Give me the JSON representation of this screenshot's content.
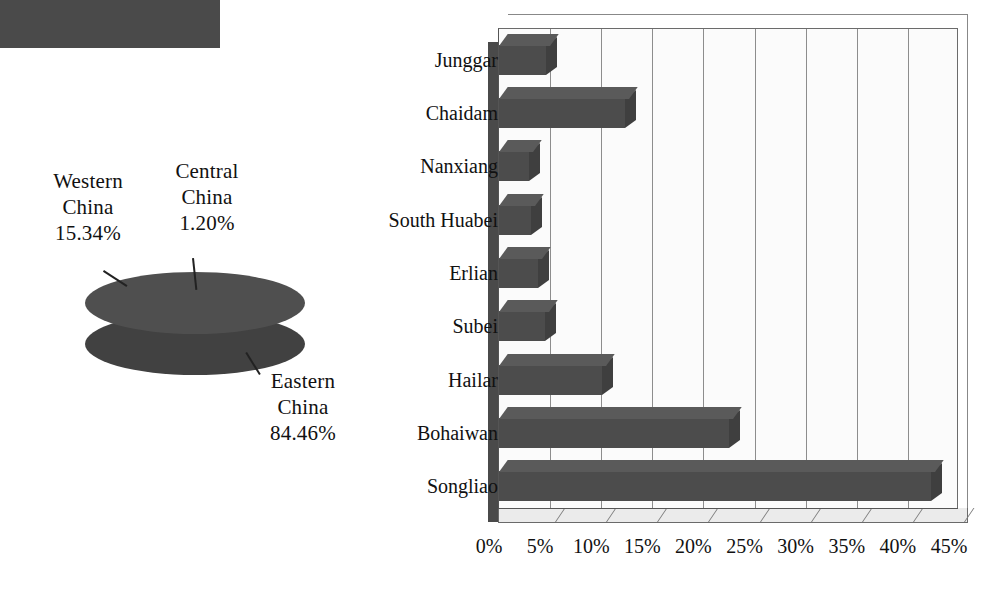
{
  "figure": {
    "title": "",
    "panels": [
      "pie-chart-china-regions",
      "bar-chart-basin-share"
    ]
  },
  "pie": {
    "slices": [
      {
        "name": "Western China",
        "line1": "Western",
        "line2": "China",
        "value_label": "15.34%",
        "value": 15.34
      },
      {
        "name": "Central China",
        "line1": "Central",
        "line2": "China",
        "value_label": "1.20%",
        "value": 1.2
      },
      {
        "name": "Eastern China",
        "line1": "Eastern",
        "line2": "China",
        "value_label": "84.46%",
        "value": 84.46
      }
    ],
    "fill_color": "#4a4a4a"
  },
  "bar": {
    "axis_ticks": [
      "0%",
      "5%",
      "10%",
      "15%",
      "20%",
      "25%",
      "30%",
      "35%",
      "40%",
      "45%"
    ],
    "categories": [
      "Junggar",
      "Chaidam",
      "Nanxiang",
      "South Huabei",
      "Erlian",
      "Subei",
      "Hailar",
      "Bohaiwan",
      "Songliao"
    ],
    "bar_color": "#4c4c4c",
    "grid_color": "#8d8d8d"
  },
  "chart_data": [
    {
      "type": "pie",
      "title": "",
      "labels": [
        "Western China",
        "Central China",
        "Eastern China"
      ],
      "values": [
        15.34,
        1.2,
        84.46
      ],
      "value_labels": [
        "15.34%",
        "1.20%",
        "84.46%"
      ],
      "unit": "%",
      "style": "3d-pie",
      "legend": "none",
      "annotations": [
        "Western China 15.34%",
        "Central China 1.20%",
        "Eastern China 84.46%"
      ]
    },
    {
      "type": "bar",
      "orientation": "horizontal",
      "style": "3d-bar",
      "title": "",
      "xlabel": "",
      "ylabel": "",
      "categories": [
        "Junggar",
        "Chaidam",
        "Nanxiang",
        "South Huabei",
        "Erlian",
        "Subei",
        "Hailar",
        "Bohaiwan",
        "Songliao"
      ],
      "values": [
        4.6,
        12.3,
        2.9,
        3.1,
        3.8,
        4.5,
        10.1,
        22.5,
        42.3
      ],
      "xlim": [
        0,
        45
      ],
      "xticks": [
        0,
        5,
        10,
        15,
        20,
        25,
        30,
        35,
        40,
        45
      ],
      "xticklabels": [
        "0%",
        "5%",
        "10%",
        "15%",
        "20%",
        "25%",
        "30%",
        "35%",
        "40%",
        "45%"
      ],
      "unit": "%",
      "grid": "vertical",
      "legend": "none"
    }
  ]
}
